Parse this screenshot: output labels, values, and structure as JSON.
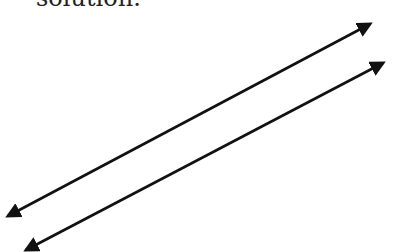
{
  "caption": {
    "text": "solution."
  },
  "diagram": {
    "type": "parallel-lines",
    "stroke_color": "#111111",
    "lines": [
      {
        "name": "line-1",
        "x1": 8,
        "y1": 216,
        "x2": 370,
        "y2": 24,
        "arrow_start": true,
        "arrow_end": true
      },
      {
        "name": "line-2",
        "x1": 26,
        "y1": 250,
        "x2": 383,
        "y2": 63,
        "arrow_start": true,
        "arrow_end": true
      }
    ]
  }
}
